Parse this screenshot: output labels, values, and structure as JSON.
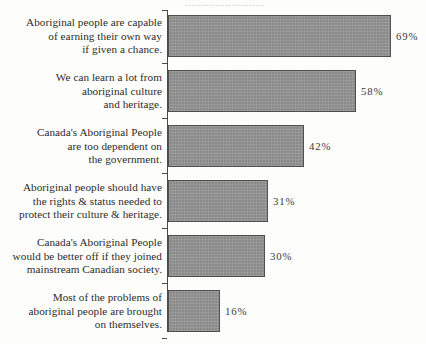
{
  "figure": {
    "top_bleed_text": "..........................",
    "axis_color": "#4a4a4a",
    "bar_fill_color": "#8b8b8b",
    "bar_border_color": "#4f4f4f",
    "text_color": "#2e2b29"
  },
  "chart_data": {
    "type": "bar",
    "orientation": "horizontal",
    "title": "",
    "xlabel": "",
    "ylabel": "",
    "xlim": [
      0,
      100
    ],
    "grid": false,
    "legend": null,
    "value_suffix": "%",
    "categories": [
      "Aboriginal people are capable\nof earning their own way\nif given a chance.",
      "We can learn a lot from\naboriginal culture\nand heritage.",
      "Canada's Aboriginal People\nare too dependent on\nthe government.",
      "Aboriginal people should have\nthe rights & status needed to\nprotect their culture & heritage.",
      "Canada's Aboriginal People\nwould be better off if they joined\nmainstream Canadian society.",
      "Most of the problems of\naboriginal people are brought\non themselves."
    ],
    "values": [
      69,
      58,
      42,
      31,
      30,
      16
    ],
    "value_labels": [
      "69%",
      "58%",
      "42%",
      "31%",
      "30%",
      "16%"
    ]
  }
}
